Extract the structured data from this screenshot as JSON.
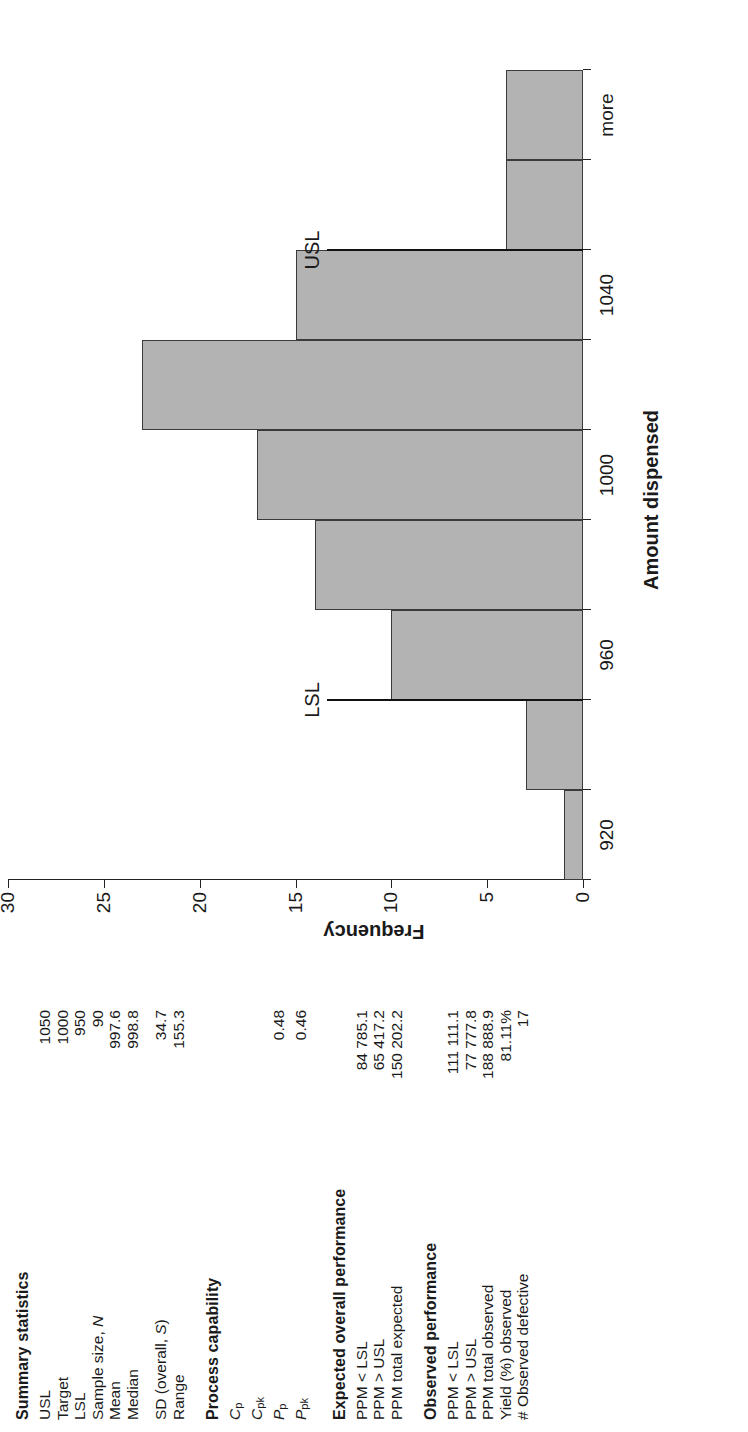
{
  "chart_data": {
    "type": "bar",
    "title": "",
    "xlabel": "Amount dispensed",
    "ylabel": "Frequency",
    "categories": [
      "920",
      "940",
      "960",
      "980",
      "1000",
      "1020",
      "1040",
      "1060",
      "more"
    ],
    "values": [
      1,
      3,
      10,
      14,
      17,
      23,
      15,
      4,
      4
    ],
    "ylim": [
      0,
      30
    ],
    "yticks": [
      "0",
      "5",
      "10",
      "15",
      "20",
      "25",
      "30"
    ],
    "ytick_values": [
      0,
      5,
      10,
      15,
      20,
      25,
      30
    ],
    "xticks": [
      "920",
      "960",
      "1000",
      "1040",
      "more"
    ],
    "grid": false,
    "legend": false,
    "bar_color": "#b3b3b3",
    "bar_edge_color": "#3a3a3a",
    "annotations": [
      {
        "label": "LSL",
        "value": 950,
        "type": "spec-limit-line"
      },
      {
        "label": "USL",
        "value": 1050,
        "type": "spec-limit-line"
      }
    ]
  },
  "summary": {
    "heading": "Summary statistics",
    "rows": [
      {
        "label": "USL",
        "value": "1050"
      },
      {
        "label": "Target",
        "value": "1000"
      },
      {
        "label": "LSL",
        "value": "950"
      },
      {
        "label": "Sample size, N",
        "value": "90"
      },
      {
        "label": "Mean",
        "value": "997.6"
      },
      {
        "label": "Median",
        "value": "998.8"
      }
    ],
    "rows2": [
      {
        "label": "SD (overall, S)",
        "value": "34.7"
      },
      {
        "label": "Range",
        "value": "155.3"
      }
    ]
  },
  "capability": {
    "heading": "Process capability",
    "rows": [
      {
        "label": "C",
        "sub": "p",
        "value": ""
      },
      {
        "label": "C",
        "sub": "pk",
        "value": ""
      },
      {
        "label": "P",
        "sub": "p",
        "value": "0.48"
      },
      {
        "label": "P",
        "sub": "pk",
        "value": "0.46"
      }
    ]
  },
  "expected": {
    "heading": "Expected overall performance",
    "rows": [
      {
        "label": "PPM < LSL",
        "value": "84 785.1"
      },
      {
        "label": "PPM > USL",
        "value": "65 417.2"
      },
      {
        "label": "PPM total expected",
        "value": "150 202.2"
      }
    ]
  },
  "observed": {
    "heading": "Observed performance",
    "rows": [
      {
        "label": "PPM < LSL",
        "value": "111 111.1"
      },
      {
        "label": "PPM > USL",
        "value": "77 777.8"
      },
      {
        "label": "PPM total observed",
        "value": "188 888.9"
      },
      {
        "label": "Yield (%) observed",
        "value": "81.11%"
      },
      {
        "label": "# Observed defective",
        "value": "17"
      }
    ]
  }
}
